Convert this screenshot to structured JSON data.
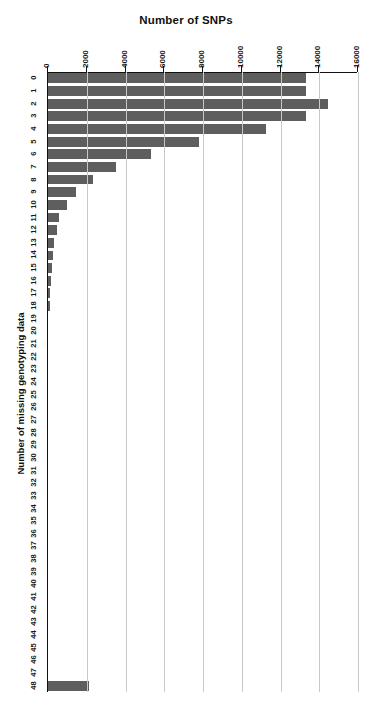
{
  "chart_data": {
    "type": "bar",
    "orientation": "horizontal",
    "title": "Number of SNPs",
    "xlabel": "Number of SNPs",
    "ylabel": "Number of missing genotyping data",
    "xlim": [
      0,
      16000
    ],
    "xticks": [
      0,
      2000,
      4000,
      6000,
      8000,
      10000,
      12000,
      14000,
      16000
    ],
    "xtick_labels": [
      "0",
      "2000",
      "4000",
      "6000",
      "8000",
      "10000",
      "12000",
      "14000",
      "16000"
    ],
    "grid": true,
    "legend": null,
    "bar_color": "#5e5e5e",
    "categories": [
      "0",
      "1",
      "2",
      "3",
      "4",
      "5",
      "6",
      "7",
      "8",
      "9",
      "10",
      "11",
      "12",
      "13",
      "14",
      "15",
      "16",
      "17",
      "18",
      "19",
      "20",
      "21",
      "22",
      "23",
      "24",
      "25",
      "26",
      "27",
      "28",
      "29",
      "30",
      "31",
      "32",
      "33",
      "34",
      "35",
      "36",
      "37",
      "38",
      "39",
      "40",
      "41",
      "42",
      "43",
      "44",
      "45",
      "46",
      "47",
      "48"
    ],
    "values": [
      13300,
      13300,
      14450,
      13300,
      11230,
      7800,
      5300,
      3530,
      2340,
      1450,
      1000,
      570,
      450,
      300,
      260,
      200,
      150,
      110,
      80,
      0,
      0,
      0,
      0,
      0,
      0,
      0,
      0,
      0,
      0,
      0,
      0,
      0,
      0,
      0,
      0,
      0,
      0,
      0,
      0,
      0,
      0,
      0,
      0,
      0,
      0,
      0,
      0,
      0,
      2130
    ]
  }
}
